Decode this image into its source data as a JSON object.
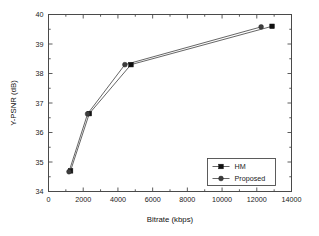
{
  "chart_data": {
    "type": "line",
    "title": "",
    "xlabel": "Bitrate (kbps)",
    "ylabel": "Y-PSNR (dB)",
    "xlim": [
      0,
      14000
    ],
    "ylim": [
      34,
      40
    ],
    "xticks": [
      0,
      2000,
      4000,
      6000,
      8000,
      10000,
      12000,
      14000
    ],
    "xtick_labels": [
      "0",
      "2000",
      "4000",
      "6000",
      "8000",
      "10000",
      "12000",
      "14000"
    ],
    "yticks": [
      34,
      35,
      36,
      37,
      38,
      39,
      40
    ],
    "ytick_labels": [
      "34",
      "35",
      "36",
      "37",
      "38",
      "39",
      "40"
    ],
    "grid": false,
    "minor_ticks": true,
    "legend_position": "lower right",
    "series": [
      {
        "name": "HM",
        "marker": "square",
        "color": "#101010",
        "x": [
          1270,
          2350,
          4750,
          12880
        ],
        "y": [
          34.7,
          36.64,
          38.3,
          39.6
        ]
      },
      {
        "name": "Proposed",
        "marker": "circle",
        "color": "#3d3d3d",
        "x": [
          1180,
          2250,
          4400,
          12250
        ],
        "y": [
          34.67,
          36.63,
          38.3,
          39.58
        ]
      }
    ]
  },
  "legend": {
    "entries": [
      {
        "label": "HM",
        "marker": "square"
      },
      {
        "label": "Proposed",
        "marker": "circle"
      }
    ]
  },
  "axes": {
    "x_title": "Bitrate (kbps)",
    "y_title": "Y-PSNR (dB)"
  }
}
